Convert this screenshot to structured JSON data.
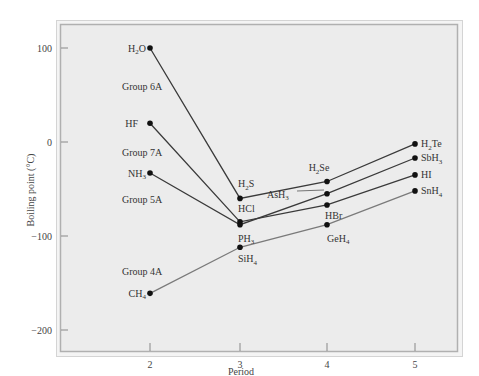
{
  "chart_data": {
    "type": "line",
    "title": "",
    "xlabel": "Period",
    "ylabel": "Boiling point (°C)",
    "x": [
      2,
      3,
      4,
      5
    ],
    "x_ticks": [
      "2",
      "3",
      "4",
      "5"
    ],
    "y_ticks": [
      "100",
      "0",
      "−100",
      "−200"
    ],
    "y_tick_values": [
      100,
      0,
      -100,
      -200
    ],
    "ylim": [
      -200,
      125
    ],
    "xlim": [
      1.05,
      5.45
    ],
    "grid": false,
    "legend": "none (inline group labels)",
    "series": [
      {
        "name": "Group 6A",
        "group_label": "Group 6A",
        "color": "#3a3a3a",
        "values": [
          100,
          -60,
          -42,
          -2
        ],
        "labels": [
          {
            "main": "H",
            "sub": "2",
            "tail": "O"
          },
          {
            "main": "H",
            "sub": "2",
            "tail": "S"
          },
          {
            "main": "H",
            "sub": "2",
            "tail": "Se"
          },
          {
            "main": "H",
            "sub": "2",
            "tail": "Te"
          }
        ]
      },
      {
        "name": "Group 7A",
        "group_label": "Group 7A",
        "color": "#3a3a3a",
        "values": [
          20,
          -85,
          -67,
          -35
        ],
        "labels": [
          {
            "main": "HF",
            "sub": "",
            "tail": ""
          },
          {
            "main": "HCl",
            "sub": "",
            "tail": ""
          },
          {
            "main": "HBr",
            "sub": "",
            "tail": ""
          },
          {
            "main": "HI",
            "sub": "",
            "tail": ""
          }
        ]
      },
      {
        "name": "Group 5A",
        "group_label": "Group 5A",
        "color": "#3a3a3a",
        "values": [
          -33,
          -88,
          -55,
          -17
        ],
        "labels": [
          {
            "main": "NH",
            "sub": "3",
            "tail": ""
          },
          {
            "main": "PH",
            "sub": "3",
            "tail": ""
          },
          {
            "main": "AsH",
            "sub": "3",
            "tail": ""
          },
          {
            "main": "SbH",
            "sub": "3",
            "tail": ""
          }
        ]
      },
      {
        "name": "Group 4A",
        "group_label": "Group 4A",
        "color": "#7a7a7a",
        "values": [
          -161,
          -112,
          -88,
          -52
        ],
        "labels": [
          {
            "main": "CH",
            "sub": "4",
            "tail": ""
          },
          {
            "main": "SiH",
            "sub": "4",
            "tail": ""
          },
          {
            "main": "GeH",
            "sub": "4",
            "tail": ""
          },
          {
            "main": "SnH",
            "sub": "4",
            "tail": ""
          }
        ]
      }
    ]
  },
  "colors": {
    "plot_bg": "#ececec",
    "frame": "#b8b8b8",
    "frame_outer": "#d4d4d4",
    "marker": "#111111",
    "text": "#333333"
  }
}
